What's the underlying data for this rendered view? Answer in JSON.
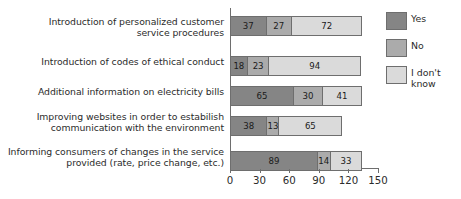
{
  "chart_data": {
    "type": "bar",
    "orientation": "horizontal",
    "stacked": true,
    "title": "",
    "xlabel": "",
    "ylabel": "",
    "xlim": [
      0,
      150
    ],
    "xticks": [
      0,
      30,
      60,
      90,
      120,
      150
    ],
    "grid": false,
    "legend_position": "right",
    "categories": [
      "Introduction of personalized customer\nservice procedures",
      "Introduction of codes of ethical conduct",
      "Additional information on electricity bills",
      "Improving websites in order to estabilish\ncommunication with the environment",
      "Informing consumers of changes in the service\nprovided (rate, price change, etc.)"
    ],
    "series": [
      {
        "name": "Yes",
        "color": "#858585",
        "values": [
          37,
          18,
          65,
          38,
          89
        ]
      },
      {
        "name": "No",
        "color": "#ababab",
        "values": [
          27,
          23,
          30,
          13,
          14
        ]
      },
      {
        "name": "I don't\nknow",
        "color": "#dadada",
        "values": [
          72,
          94,
          41,
          65,
          33
        ]
      }
    ],
    "bar_labels": [
      [
        "37",
        "27",
        "72"
      ],
      [
        "18",
        "23",
        "94"
      ],
      [
        "65",
        "30",
        "41"
      ],
      [
        "38",
        "13",
        "65"
      ],
      [
        "89",
        "14",
        "33"
      ]
    ],
    "totals": [
      136,
      135,
      136,
      116,
      136
    ]
  },
  "axis": {
    "tick_labels": [
      "0",
      "30",
      "60",
      "90",
      "120",
      "150"
    ]
  },
  "legend": {
    "items": [
      {
        "label": "Yes"
      },
      {
        "label": "No"
      },
      {
        "label": "I don't\nknow"
      }
    ]
  }
}
